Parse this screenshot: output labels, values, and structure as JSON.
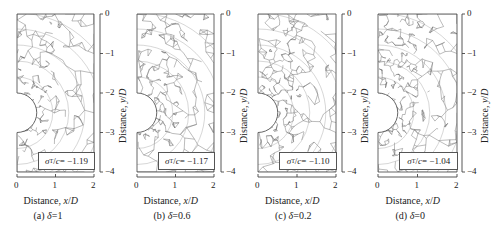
{
  "figure": {
    "panels": [
      {
        "id": "a",
        "caption": "(a) δ=1",
        "legend": "σT/c= −1.19",
        "legend_sub": "T",
        "delta": 1,
        "value": -1.19,
        "box": {
          "left": 17,
          "right": 94
        },
        "axis_x": 100,
        "density": 0.35
      },
      {
        "id": "b",
        "caption": "(b) δ=0.6",
        "legend": "σT/c= −1.17",
        "legend_sub": "T",
        "delta": 0.6,
        "value": -1.17,
        "box": {
          "left": 137,
          "right": 214
        },
        "axis_x": 221,
        "density": 0.5
      },
      {
        "id": "c",
        "caption": "(c) δ=0.2",
        "legend": "σT/c= −1.10",
        "legend_sub": "T",
        "delta": 0.2,
        "value": -1.1,
        "box": {
          "left": 258,
          "right": 336
        },
        "axis_x": 342,
        "density": 0.7
      },
      {
        "id": "d",
        "caption": "(d) δ=0",
        "legend": "σT/c= −1.04",
        "legend_sub": "T",
        "delta": 0,
        "value": -1.04,
        "box": {
          "left": 378,
          "right": 457
        },
        "axis_x": 462,
        "density": 0.85
      }
    ],
    "x_axis": {
      "label": "Distance, x/D",
      "ticks": [
        "0",
        "1",
        "2"
      ],
      "range": [
        0,
        2
      ]
    },
    "y_axis": {
      "label": "Distance, y/D",
      "ticks": [
        "0",
        "−1",
        "−2",
        "−3",
        "−4"
      ],
      "range": [
        0,
        -4
      ]
    },
    "geometry": {
      "top": 14,
      "bottom": 172,
      "hole_center_y": -2.5,
      "hole_radius": 0.5
    }
  },
  "chart_data": {
    "type": "other",
    "title": "",
    "xlabel": "Distance, x/D",
    "ylabel": "Distance, y/D",
    "xlim": [
      0,
      2
    ],
    "ylim": [
      -4,
      0
    ],
    "x_ticks": [
      0,
      1,
      2
    ],
    "y_ticks": [
      0,
      -1,
      -2,
      -3,
      -4
    ],
    "series": [
      {
        "name": "(a) δ=1",
        "delta": 1,
        "sigma_T_over_c": -1.19
      },
      {
        "name": "(b) δ=0.6",
        "delta": 0.6,
        "sigma_T_over_c": -1.17
      },
      {
        "name": "(c) δ=0.2",
        "delta": 0.2,
        "sigma_T_over_c": -1.1
      },
      {
        "name": "(d) δ=0",
        "delta": 0,
        "sigma_T_over_c": -1.04
      }
    ]
  }
}
